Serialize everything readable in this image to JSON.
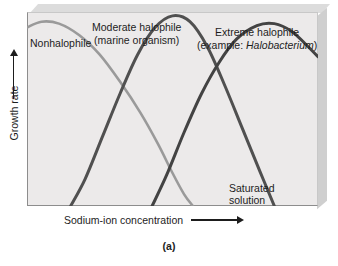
{
  "figure": {
    "caption": "(a)",
    "panel_background": "#eceaea",
    "frame_color": "#8d8d8d"
  },
  "axes": {
    "x_title": "Sodium-ion concentration",
    "y_title": "Growth rate",
    "x_arrow": "arrow-right",
    "y_arrow": "arrow-up"
  },
  "annotations": {
    "saturated_line1": "Saturated",
    "saturated_line2": "solution"
  },
  "chart_data": {
    "type": "line",
    "title": "",
    "subtitle": "",
    "xlabel": "Sodium-ion concentration",
    "ylabel": "Growth rate",
    "xlim": [
      0,
      100
    ],
    "ylim": [
      0,
      100
    ],
    "grid": false,
    "legend": "inline-curve-labels",
    "x_ticks": [],
    "y_ticks": [],
    "annotations": [
      {
        "text": "Saturated solution",
        "lines": [
          "Saturated",
          "solution"
        ],
        "x": 70,
        "y": 10
      }
    ],
    "series": [
      {
        "name": "Nonhalophile",
        "label_lines": [
          "Nonhalophile"
        ],
        "color": "#9a9a9a",
        "linewidth": 2.6,
        "points": [
          {
            "x": 0,
            "y": 92
          },
          {
            "x": 5,
            "y": 95
          },
          {
            "x": 11,
            "y": 94
          },
          {
            "x": 18,
            "y": 88
          },
          {
            "x": 25,
            "y": 78
          },
          {
            "x": 32,
            "y": 64
          },
          {
            "x": 39,
            "y": 48
          },
          {
            "x": 45,
            "y": 32
          },
          {
            "x": 50,
            "y": 17
          },
          {
            "x": 54,
            "y": 6
          },
          {
            "x": 57,
            "y": 0
          }
        ]
      },
      {
        "name": "Moderate halophile (marine organism)",
        "label_lines": [
          "Moderate halophile",
          "(marine organism)"
        ],
        "color": "#505050",
        "linewidth": 3.0,
        "points": [
          {
            "x": 15,
            "y": 0
          },
          {
            "x": 20,
            "y": 14
          },
          {
            "x": 26,
            "y": 36
          },
          {
            "x": 32,
            "y": 58
          },
          {
            "x": 38,
            "y": 78
          },
          {
            "x": 44,
            "y": 92
          },
          {
            "x": 50,
            "y": 98
          },
          {
            "x": 56,
            "y": 95
          },
          {
            "x": 62,
            "y": 82
          },
          {
            "x": 68,
            "y": 62
          },
          {
            "x": 74,
            "y": 40
          },
          {
            "x": 80,
            "y": 18
          },
          {
            "x": 85,
            "y": 0
          }
        ]
      },
      {
        "name": "Extreme halophile (example: Halobacterium)",
        "label_lines": [
          "Extreme  halophile",
          "(example: Halobacterium)"
        ],
        "label_italic_part": "Halobacterium",
        "color": "#434343",
        "linewidth": 3.0,
        "points": [
          {
            "x": 43,
            "y": 0
          },
          {
            "x": 48,
            "y": 16
          },
          {
            "x": 54,
            "y": 38
          },
          {
            "x": 60,
            "y": 58
          },
          {
            "x": 66,
            "y": 74
          },
          {
            "x": 72,
            "y": 86
          },
          {
            "x": 79,
            "y": 93
          },
          {
            "x": 85,
            "y": 94
          },
          {
            "x": 91,
            "y": 90
          },
          {
            "x": 96,
            "y": 83
          },
          {
            "x": 100,
            "y": 77
          }
        ]
      }
    ]
  }
}
